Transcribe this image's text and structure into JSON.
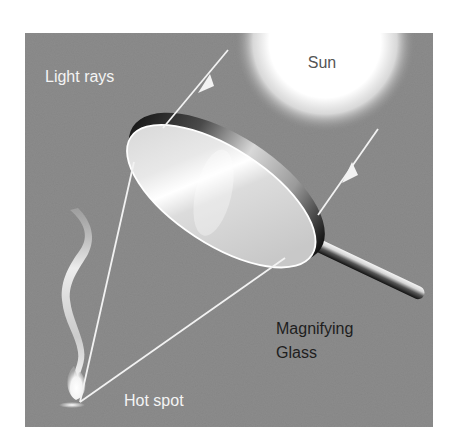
{
  "diagram": {
    "labels": {
      "sun": "Sun",
      "light_rays": "Light rays",
      "magnifying_line1": "Magnifying",
      "magnifying_line2": "Glass",
      "hot_spot": "Hot spot"
    },
    "colors": {
      "panel_bg": "#8c8c8c",
      "outer_bg": "#ffffff",
      "ray": "#f2f2f2",
      "light_text": "#f4f4f4",
      "dark_text": "#1e1e1e",
      "sun_core": "#ffffff"
    },
    "elements": [
      "sun",
      "light-ray-1",
      "light-ray-2",
      "magnifying-glass-lens",
      "magnifying-glass-handle",
      "converging-ray-left",
      "converging-ray-right",
      "smoke",
      "flame",
      "hot-spot"
    ]
  }
}
